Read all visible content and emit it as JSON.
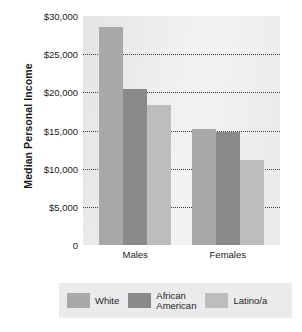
{
  "chart_data": {
    "type": "bar",
    "title": "",
    "xlabel": "",
    "ylabel": "Median Personal Income",
    "categories": [
      "Males",
      "Females"
    ],
    "series": [
      {
        "name": "White",
        "values": [
          28500,
          15200
        ],
        "color": "#a8a8a8"
      },
      {
        "name": "African\nAmerican",
        "values": [
          20500,
          14800
        ],
        "color": "#8a8a8a"
      },
      {
        "name": "Latino/a",
        "values": [
          18300,
          11200
        ],
        "color": "#bdbdbd"
      }
    ],
    "ylim": [
      0,
      30000
    ],
    "yticks": [
      0,
      5000,
      10000,
      15000,
      20000,
      25000,
      30000
    ],
    "ytick_labels": [
      "0",
      "$5,000",
      "$10,000",
      "$15,000",
      "$20,000",
      "$25,000",
      "$30,000"
    ],
    "grid": true,
    "gridlines_at": [
      5000,
      10000,
      15000,
      20000,
      25000
    ],
    "legend_position": "bottom"
  },
  "legend": {
    "items": [
      {
        "label": "White",
        "color": "#a8a8a8"
      },
      {
        "label": "African\nAmerican",
        "color": "#8a8a8a"
      },
      {
        "label": "Latino/a",
        "color": "#bdbdbd"
      }
    ]
  },
  "colors": {
    "plot_background": "#ececec",
    "legend_background": "#ebebeb",
    "gridline": "#3a3a3a",
    "text": "#222222"
  }
}
